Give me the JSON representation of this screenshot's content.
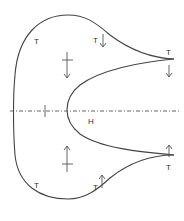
{
  "diagram": {
    "labels": {
      "t_top_left": "T",
      "t_top_mid": "T",
      "t_top_right": "T",
      "t_bottom_left": "T",
      "t_bottom_mid": "T",
      "t_bottom_right": "T",
      "h_label": "H"
    },
    "colors": {
      "stroke": "#444444",
      "text": "#333333",
      "background": "#ffffff"
    }
  }
}
